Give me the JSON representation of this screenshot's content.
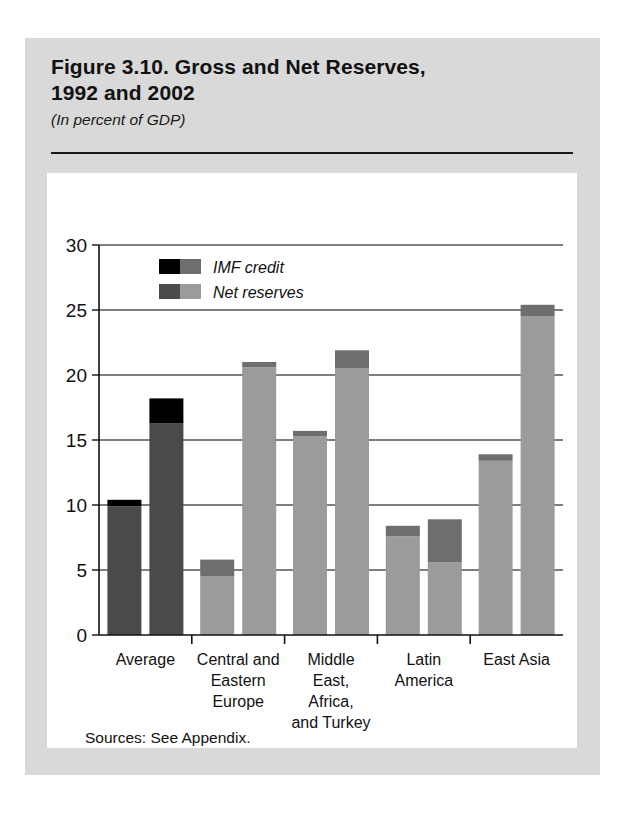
{
  "figure": {
    "title_line1": "Figure 3.10. Gross and Net Reserves,",
    "title_line2": "1992 and 2002",
    "subtitle": "(In percent of GDP)",
    "sources": "Sources: See Appendix."
  },
  "colors": {
    "card_background": "#d9d9d9",
    "panel_background": "#ffffff",
    "imf_credit_dark": "#000000",
    "net_reserves_dark": "#4a4a4a",
    "imf_credit_light": "#6e6e6e",
    "net_reserves_light": "#9b9b9b",
    "axis": "#111111",
    "gridline": "#555555"
  },
  "chart_data": {
    "type": "bar",
    "title": "Figure 3.10. Gross and Net Reserves, 1992 and 2002",
    "subtitle": "(In percent of GDP)",
    "xlabel": "",
    "ylabel": "",
    "ylim": [
      0,
      30
    ],
    "yticks": [
      0,
      5,
      10,
      15,
      20,
      25,
      30
    ],
    "ytick_labels": [
      "0",
      "5",
      "10",
      "15",
      "20",
      "25",
      "30"
    ],
    "grid": true,
    "stacked": true,
    "legend_position": "top-left",
    "legend": [
      {
        "label": "IMF credit",
        "swatch_dark": "#000000",
        "swatch_light": "#6e6e6e"
      },
      {
        "label": "Net reserves",
        "swatch_dark": "#4a4a4a",
        "swatch_light": "#9b9b9b"
      }
    ],
    "categories": [
      "Average",
      "Central and Eastern Europe",
      "Middle East, Africa, and Turkey",
      "Latin America",
      "East Asia"
    ],
    "category_label_lines": [
      [
        "Average"
      ],
      [
        "Central and",
        "Eastern",
        "Europe"
      ],
      [
        "Middle",
        "East,",
        "Africa,",
        "and Turkey"
      ],
      [
        "Latin",
        "America"
      ],
      [
        "East Asia"
      ]
    ],
    "series": [
      {
        "name": "1992",
        "net_reserves": [
          9.9,
          4.5,
          15.3,
          7.6,
          13.4
        ],
        "imf_credit": [
          0.5,
          1.3,
          0.4,
          0.8,
          0.5
        ],
        "gross_reserves": [
          10.4,
          5.8,
          15.7,
          8.4,
          13.9
        ]
      },
      {
        "name": "2002",
        "net_reserves": [
          16.3,
          20.6,
          20.5,
          5.6,
          24.5
        ],
        "imf_credit": [
          1.9,
          0.4,
          1.4,
          3.3,
          0.9
        ],
        "gross_reserves": [
          18.2,
          21.0,
          21.9,
          8.9,
          25.4
        ]
      }
    ]
  }
}
